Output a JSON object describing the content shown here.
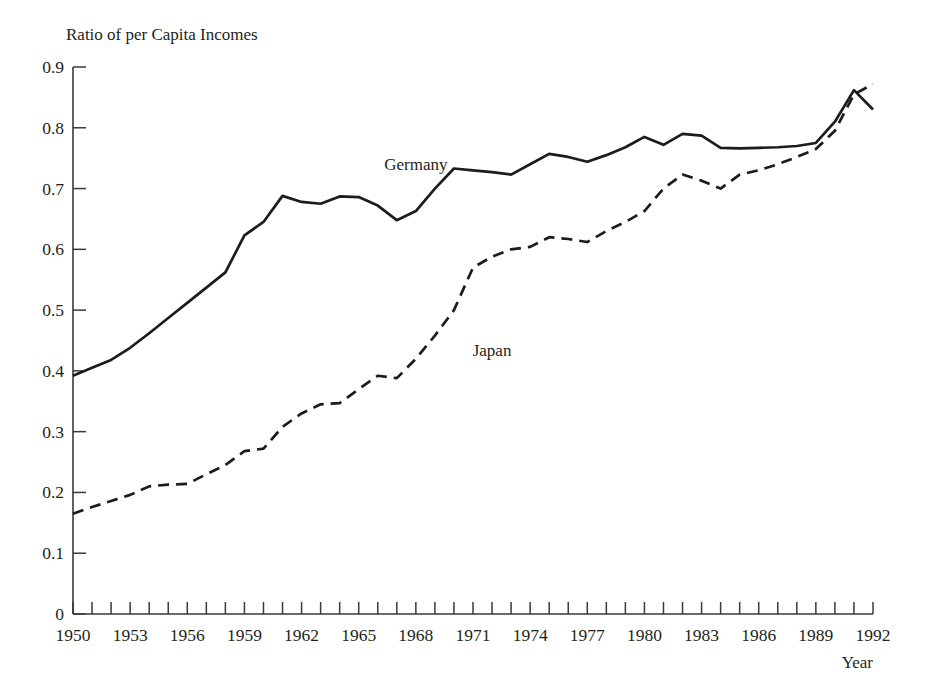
{
  "chart_data": {
    "type": "line",
    "title": "Ratio of per Capita Incomes",
    "xlabel": "Year",
    "ylabel": "",
    "xlim": [
      1950,
      1992
    ],
    "ylim": [
      0,
      0.9
    ],
    "grid": false,
    "legend": "inline-annotations",
    "y_ticks": [
      "0",
      "0.1",
      "0.2",
      "0.3",
      "0.4",
      "0.5",
      "0.6",
      "0.7",
      "0.8",
      "0.9"
    ],
    "y_tick_values": [
      0,
      0.1,
      0.2,
      0.3,
      0.4,
      0.5,
      0.6,
      0.7,
      0.8,
      0.9
    ],
    "x_ticks": [
      "1950",
      "1953",
      "1956",
      "1959",
      "1962",
      "1965",
      "1968",
      "1971",
      "1974",
      "1977",
      "1980",
      "1983",
      "1986",
      "1989",
      "1992"
    ],
    "x_tick_values": [
      1950,
      1953,
      1956,
      1959,
      1962,
      1965,
      1968,
      1971,
      1974,
      1977,
      1980,
      1983,
      1986,
      1989,
      1992
    ],
    "x_minor_tick_step": 1,
    "x": [
      1950,
      1951,
      1952,
      1953,
      1954,
      1955,
      1956,
      1957,
      1958,
      1959,
      1960,
      1961,
      1962,
      1963,
      1964,
      1965,
      1966,
      1967,
      1968,
      1969,
      1970,
      1971,
      1972,
      1973,
      1974,
      1975,
      1976,
      1977,
      1978,
      1979,
      1980,
      1981,
      1982,
      1983,
      1984,
      1985,
      1986,
      1987,
      1988,
      1989,
      1990,
      1991,
      1992
    ],
    "series": [
      {
        "name": "Germany",
        "style": "solid",
        "color": "#1c1c1c",
        "label_x": 1968,
        "label_y": 0.73,
        "values": [
          0.392,
          0.405,
          0.418,
          0.438,
          0.462,
          0.487,
          0.512,
          0.537,
          0.562,
          0.623,
          0.645,
          0.688,
          0.678,
          0.675,
          0.687,
          0.686,
          0.672,
          0.648,
          0.663,
          0.7,
          0.733,
          0.73,
          0.727,
          0.723,
          0.74,
          0.757,
          0.752,
          0.744,
          0.755,
          0.768,
          0.785,
          0.772,
          0.79,
          0.787,
          0.767,
          0.766,
          0.767,
          0.768,
          0.77,
          0.775,
          0.81,
          0.862,
          0.83
        ]
      },
      {
        "name": "Japan",
        "style": "dashed",
        "color": "#1c1c1c",
        "label_x": 1972,
        "label_y": 0.425,
        "values": [
          0.165,
          0.176,
          0.186,
          0.196,
          0.21,
          0.213,
          0.214,
          0.23,
          0.245,
          0.268,
          0.272,
          0.308,
          0.33,
          0.345,
          0.347,
          0.37,
          0.392,
          0.388,
          0.42,
          0.458,
          0.5,
          0.57,
          0.588,
          0.6,
          0.604,
          0.62,
          0.617,
          0.612,
          0.63,
          0.645,
          0.663,
          0.7,
          0.723,
          0.713,
          0.7,
          0.723,
          0.73,
          0.74,
          0.752,
          0.765,
          0.795,
          0.855,
          0.872
        ]
      }
    ]
  },
  "axes": {
    "y_axis_title": "Ratio of per Capita Incomes",
    "x_axis_title": "Year"
  }
}
